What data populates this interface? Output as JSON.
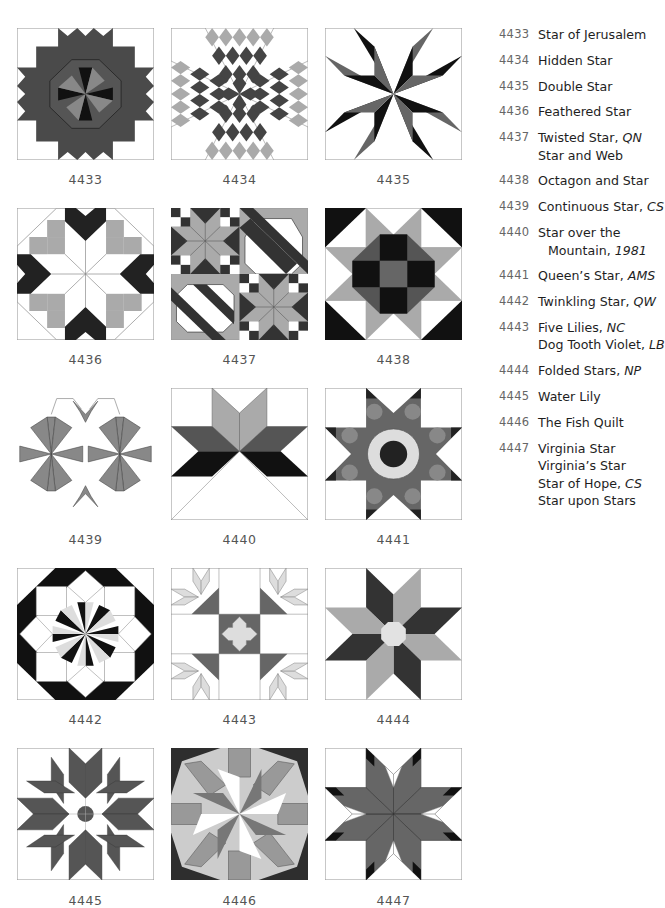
{
  "page": {
    "colors": {
      "outline": "#9a9a9a",
      "black": "#1a1a1a",
      "dark": "#3a3a3a",
      "mid": "#6e6e6e",
      "light": "#a8a8a8",
      "pale": "#d4d4d4",
      "white": "#ffffff"
    }
  },
  "blocks": [
    {
      "id": "4433",
      "caption": "4433"
    },
    {
      "id": "4434",
      "caption": "4434"
    },
    {
      "id": "4435",
      "caption": "4435"
    },
    {
      "id": "4436",
      "caption": "4436"
    },
    {
      "id": "4437",
      "caption": "4437"
    },
    {
      "id": "4438",
      "caption": "4438"
    },
    {
      "id": "4439",
      "caption": "4439"
    },
    {
      "id": "4440",
      "caption": "4440"
    },
    {
      "id": "4441",
      "caption": "4441"
    },
    {
      "id": "4442",
      "caption": "4442"
    },
    {
      "id": "4443",
      "caption": "4443"
    },
    {
      "id": "4444",
      "caption": "4444"
    },
    {
      "id": "4445",
      "caption": "4445"
    },
    {
      "id": "4446",
      "caption": "4446"
    },
    {
      "id": "4447",
      "caption": "4447"
    }
  ],
  "index": [
    {
      "num": "4433",
      "lines": [
        {
          "text": "Star of Jerusalem",
          "source": ""
        }
      ]
    },
    {
      "num": "4434",
      "lines": [
        {
          "text": "Hidden Star",
          "source": ""
        }
      ]
    },
    {
      "num": "4435",
      "lines": [
        {
          "text": "Double Star",
          "source": ""
        }
      ]
    },
    {
      "num": "4436",
      "lines": [
        {
          "text": "Feathered Star",
          "source": ""
        }
      ]
    },
    {
      "num": "4437",
      "lines": [
        {
          "text": "Twisted Star, ",
          "source": "QN"
        },
        {
          "text": "Star and Web",
          "source": ""
        }
      ]
    },
    {
      "num": "4438",
      "lines": [
        {
          "text": "Octagon and Star",
          "source": ""
        }
      ]
    },
    {
      "num": "4439",
      "lines": [
        {
          "text": "Continuous Star, ",
          "source": "CS"
        }
      ]
    },
    {
      "num": "4440",
      "lines": [
        {
          "text": "Star over the",
          "source": ""
        },
        {
          "text": "Mountain, ",
          "source": "1981",
          "indent": true
        }
      ]
    },
    {
      "num": "4441",
      "lines": [
        {
          "text": "Queen’s Star, ",
          "source": "AMS"
        }
      ]
    },
    {
      "num": "4442",
      "lines": [
        {
          "text": "Twinkling Star, ",
          "source": "QW"
        }
      ]
    },
    {
      "num": "4443",
      "lines": [
        {
          "text": "Five Lilies, ",
          "source": "NC"
        },
        {
          "text": "Dog Tooth Violet, ",
          "source": "LB"
        }
      ]
    },
    {
      "num": "4444",
      "lines": [
        {
          "text": "Folded Stars, ",
          "source": "NP"
        }
      ]
    },
    {
      "num": "4445",
      "lines": [
        {
          "text": "Water Lily",
          "source": ""
        }
      ]
    },
    {
      "num": "4446",
      "lines": [
        {
          "text": "The Fish Quilt",
          "source": ""
        }
      ]
    },
    {
      "num": "4447",
      "lines": [
        {
          "text": "Virginia Star",
          "source": ""
        },
        {
          "text": "Virginia’s Star",
          "source": ""
        },
        {
          "text": "Star of Hope, ",
          "source": "CS"
        },
        {
          "text": "Star upon Stars",
          "source": ""
        }
      ]
    }
  ]
}
